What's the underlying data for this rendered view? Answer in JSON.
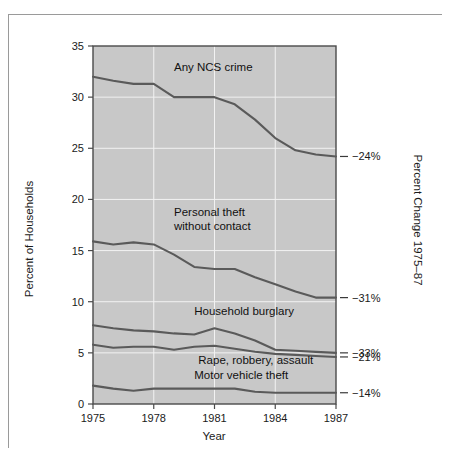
{
  "figure": {
    "background_color": "#ffffff",
    "plot_background_color": "#c8c8c8",
    "line_color": "#5a5a5a",
    "frame_color": "#9a9a9a"
  },
  "chart_data": {
    "type": "line",
    "title": "",
    "xlabel": "Year",
    "ylabel": "Percent of Households",
    "y2label": "Percent Change 1975-87",
    "xlim": [
      1975,
      1987
    ],
    "ylim": [
      0,
      35
    ],
    "xticks": [
      1975,
      1978,
      1981,
      1984,
      1987
    ],
    "xticklabels": [
      "1975",
      "1978",
      "1981",
      "1984",
      "1987"
    ],
    "yticks": [
      0,
      5,
      10,
      15,
      20,
      25,
      30,
      35
    ],
    "yticklabels": [
      "0",
      "5",
      "10",
      "15",
      "20",
      "25",
      "30",
      "35"
    ],
    "grid": true,
    "legend": "inline-labels",
    "x": [
      1975,
      1976,
      1977,
      1978,
      1979,
      1980,
      1981,
      1982,
      1983,
      1984,
      1985,
      1986,
      1987
    ],
    "series": [
      {
        "name": "Any NCS crime",
        "label": "Any NCS crime",
        "label_x": 1979.0,
        "label_y": 32.6,
        "values": [
          32.0,
          31.6,
          31.3,
          31.3,
          30.0,
          30.0,
          30.0,
          29.3,
          27.8,
          26.0,
          24.8,
          24.4,
          24.2
        ],
        "percent_change": "-24%",
        "percent_change_label": "−24%"
      },
      {
        "name": "Personal theft without contact",
        "label": "Personal theft\nwithout contact",
        "label_line1": "Personal theft",
        "label_line2": "without contact",
        "label_x": 1979.0,
        "label_y": 18.4,
        "values": [
          15.9,
          15.6,
          15.8,
          15.6,
          14.6,
          13.4,
          13.2,
          13.2,
          12.4,
          11.7,
          11.0,
          10.4,
          10.4
        ],
        "percent_change": "-31%",
        "percent_change_label": "−31%"
      },
      {
        "name": "Household burglary",
        "label": "Household burglary",
        "label_x": 1980.0,
        "label_y": 8.7,
        "values": [
          7.7,
          7.4,
          7.2,
          7.1,
          6.9,
          6.8,
          7.4,
          6.9,
          6.2,
          5.3,
          5.2,
          5.1,
          5.0
        ],
        "percent_change": "-33%",
        "percent_change_label": "−33%"
      },
      {
        "name": "Rape, robbery, assault",
        "label": "Rape, robbery, assault",
        "label_x": 1980.2,
        "label_y": 3.9,
        "values": [
          5.8,
          5.5,
          5.6,
          5.6,
          5.3,
          5.6,
          5.7,
          5.4,
          5.1,
          4.9,
          4.8,
          4.7,
          4.6
        ],
        "percent_change": "-21%",
        "percent_change_label": "−21%"
      },
      {
        "name": "Motor vehicle theft",
        "label": "Motor vehicle theft",
        "label_x": 1980.0,
        "label_y": 2.4,
        "values": [
          1.8,
          1.5,
          1.3,
          1.5,
          1.5,
          1.5,
          1.5,
          1.5,
          1.2,
          1.1,
          1.1,
          1.1,
          1.1
        ],
        "percent_change": "-14%",
        "percent_change_label": "−14%"
      }
    ]
  }
}
